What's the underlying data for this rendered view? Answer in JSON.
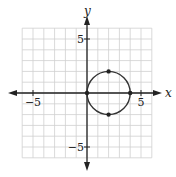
{
  "chart_data": {
    "type": "scatter",
    "title": "",
    "xlabel": "x",
    "ylabel": "y",
    "xlim": [
      -6,
      6
    ],
    "ylim": [
      -6,
      6
    ],
    "grid": true,
    "x_ticks": [
      {
        "value": -5,
        "label": "−5"
      },
      {
        "value": 5,
        "label": "5"
      }
    ],
    "y_ticks": [
      {
        "value": 5,
        "label": "5"
      },
      {
        "value": -5,
        "label": "−5"
      }
    ],
    "circle": {
      "center": [
        2,
        0
      ],
      "radius": 2
    },
    "points": [
      {
        "x": 0,
        "y": 0
      },
      {
        "x": 4,
        "y": 0
      },
      {
        "x": 2,
        "y": 2
      },
      {
        "x": 2,
        "y": -2
      }
    ]
  },
  "colors": {
    "grid": "#cfcfcf",
    "axis": "#222222",
    "curve": "#333333"
  }
}
